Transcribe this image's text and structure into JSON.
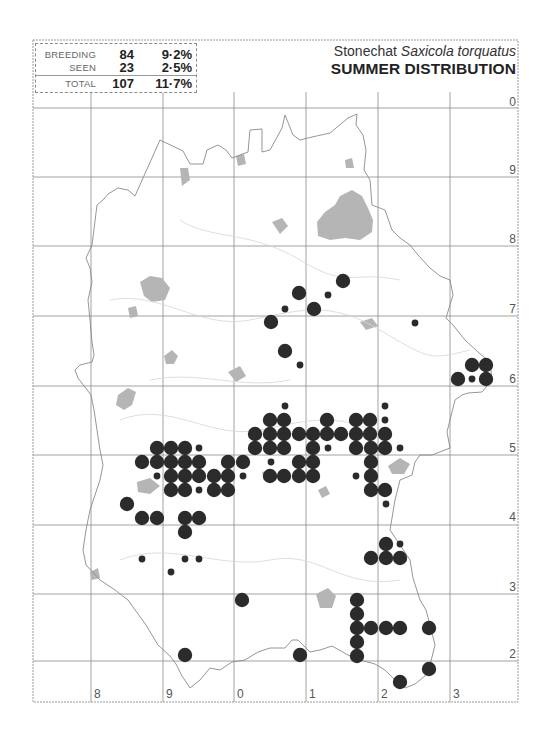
{
  "title": {
    "common_name": "Stonechat",
    "scientific_name": "Saxicola torquatus",
    "subtitle": "SUMMER DISTRIBUTION"
  },
  "stats": {
    "rows": [
      {
        "label": "BREEDING",
        "count": "84",
        "percent": "9·2%"
      },
      {
        "label": "SEEN",
        "count": "23",
        "percent": "2·5%"
      },
      {
        "label": "TOTAL",
        "count": "107",
        "percent": "11·7%"
      }
    ]
  },
  "grid": {
    "x_labels": [
      "8",
      "9",
      "0",
      "1",
      "2",
      "3"
    ],
    "y_labels": [
      "0",
      "9",
      "8",
      "7",
      "6",
      "5",
      "4",
      "3",
      "2"
    ]
  },
  "legend": {
    "large_dot": "breeding",
    "small_dot": "seen"
  },
  "colors": {
    "dot": "#2b2b2b",
    "grid": "#8c8c8c",
    "boundary": "#8a8a8a",
    "urban": "#b5b5b5"
  },
  "records": {
    "breeding": [
      [
        343,
        281
      ],
      [
        299,
        293
      ],
      [
        314,
        309
      ],
      [
        271,
        322
      ],
      [
        285,
        351
      ],
      [
        472,
        365
      ],
      [
        486,
        365
      ],
      [
        458,
        379
      ],
      [
        486,
        379
      ],
      [
        270,
        420
      ],
      [
        284,
        420
      ],
      [
        327,
        420
      ],
      [
        356,
        420
      ],
      [
        370,
        420
      ],
      [
        255,
        434
      ],
      [
        270,
        434
      ],
      [
        284,
        434
      ],
      [
        299,
        434
      ],
      [
        313,
        434
      ],
      [
        327,
        434
      ],
      [
        341,
        434
      ],
      [
        356,
        434
      ],
      [
        370,
        434
      ],
      [
        385,
        434
      ],
      [
        157,
        448
      ],
      [
        171,
        448
      ],
      [
        185,
        448
      ],
      [
        255,
        448
      ],
      [
        270,
        448
      ],
      [
        284,
        448
      ],
      [
        313,
        448
      ],
      [
        356,
        448
      ],
      [
        371,
        448
      ],
      [
        385,
        448
      ],
      [
        142,
        462
      ],
      [
        157,
        462
      ],
      [
        171,
        462
      ],
      [
        185,
        462
      ],
      [
        199,
        462
      ],
      [
        228,
        462
      ],
      [
        243,
        462
      ],
      [
        299,
        462
      ],
      [
        313,
        462
      ],
      [
        371,
        462
      ],
      [
        171,
        476
      ],
      [
        185,
        476
      ],
      [
        199,
        476
      ],
      [
        214,
        476
      ],
      [
        228,
        476
      ],
      [
        270,
        476
      ],
      [
        284,
        476
      ],
      [
        299,
        476
      ],
      [
        313,
        476
      ],
      [
        371,
        476
      ],
      [
        171,
        490
      ],
      [
        185,
        490
      ],
      [
        214,
        490
      ],
      [
        228,
        490
      ],
      [
        371,
        490
      ],
      [
        385,
        490
      ],
      [
        127,
        504
      ],
      [
        142,
        518
      ],
      [
        157,
        518
      ],
      [
        185,
        518
      ],
      [
        199,
        518
      ],
      [
        185,
        532
      ],
      [
        386,
        544
      ],
      [
        371,
        558
      ],
      [
        386,
        558
      ],
      [
        400,
        558
      ],
      [
        242,
        600
      ],
      [
        357,
        600
      ],
      [
        357,
        614
      ],
      [
        357,
        628
      ],
      [
        371,
        628
      ],
      [
        386,
        628
      ],
      [
        400,
        628
      ],
      [
        429,
        628
      ],
      [
        357,
        642
      ],
      [
        357,
        656
      ],
      [
        300,
        655
      ],
      [
        185,
        655
      ],
      [
        429,
        669
      ],
      [
        400,
        682
      ]
    ],
    "seen": [
      [
        328,
        295
      ],
      [
        285,
        309
      ],
      [
        300,
        365
      ],
      [
        472,
        379
      ],
      [
        415,
        323
      ],
      [
        285,
        406
      ],
      [
        385,
        406
      ],
      [
        385,
        420
      ],
      [
        199,
        448
      ],
      [
        328,
        448
      ],
      [
        400,
        448
      ],
      [
        271,
        462
      ],
      [
        157,
        476
      ],
      [
        243,
        476
      ],
      [
        356,
        476
      ],
      [
        199,
        490
      ],
      [
        386,
        504
      ],
      [
        142,
        559
      ],
      [
        185,
        559
      ],
      [
        199,
        559
      ],
      [
        171,
        572
      ],
      [
        400,
        544
      ]
    ]
  }
}
